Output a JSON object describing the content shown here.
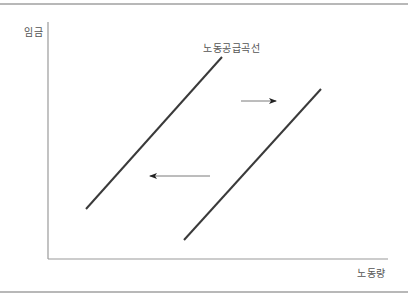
{
  "diagram": {
    "type": "labor-supply-curve-shift",
    "axes": {
      "y_label": "임금",
      "x_label": "노동량"
    },
    "curve_label": "노동공급곡선",
    "curves": [
      {
        "name": "original-supply",
        "x1": 86,
        "y1": 209,
        "x2": 222,
        "y2": 57
      },
      {
        "name": "shifted-supply",
        "x1": 184,
        "y1": 240,
        "x2": 321,
        "y2": 89
      }
    ],
    "arrows": [
      {
        "name": "shift-right",
        "direction": "right",
        "x1": 241,
        "y1": 101,
        "x2": 276,
        "y2": 101
      },
      {
        "name": "shift-left",
        "direction": "left",
        "x1": 210,
        "y1": 176,
        "x2": 150,
        "y2": 176
      }
    ],
    "colors": {
      "curve": "#3a3a3a",
      "axis": "#9a9a9a",
      "arrow": "#7a7a7a",
      "arrowhead": "#222222",
      "text": "#555555",
      "frame": "#b8b8b8"
    }
  }
}
